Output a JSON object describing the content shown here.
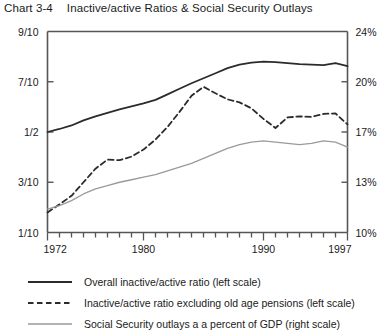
{
  "header": {
    "chart_number": "Chart 3-4",
    "title": "Inactive/active Ratios & Social Security Outlays"
  },
  "chart_data": {
    "type": "line",
    "title": "Inactive/active Ratios & Social Security Outlays",
    "xlabel": "",
    "ylabel": "",
    "grid": false,
    "legend_position": "below",
    "xlim": [
      1972,
      1997
    ],
    "x_tick_labels": [
      "1972",
      "1980",
      "1990",
      "1997"
    ],
    "x_tick_years": [
      1972,
      1980,
      1990,
      1997
    ],
    "x_minor_tick_years": [
      1972,
      1973,
      1974,
      1975,
      1976,
      1977,
      1978,
      1979,
      1980,
      1981,
      1982,
      1983,
      1984,
      1985,
      1986,
      1987,
      1988,
      1989,
      1990,
      1991,
      1992,
      1993,
      1994,
      1995,
      1996,
      1997
    ],
    "left_axis": {
      "label": "Inactive/active ratio",
      "tick_labels": [
        "9/10",
        "7/10",
        "1/2",
        "3/10",
        "1/10"
      ],
      "tick_values": [
        0.9,
        0.7,
        0.5,
        0.3,
        0.1
      ],
      "ylim": [
        0.1,
        0.9
      ]
    },
    "right_axis": {
      "label": "Percent of GDP",
      "tick_labels": [
        "24%",
        "20%",
        "17%",
        "13%",
        "10%"
      ],
      "tick_values": [
        24,
        20,
        17,
        13,
        10
      ],
      "ylim": [
        10,
        24
      ]
    },
    "x": [
      1972,
      1973,
      1974,
      1975,
      1976,
      1977,
      1978,
      1979,
      1980,
      1981,
      1982,
      1983,
      1984,
      1985,
      1986,
      1987,
      1988,
      1989,
      1990,
      1991,
      1992,
      1993,
      1994,
      1995,
      1996,
      1997
    ],
    "series": [
      {
        "name": "Overall inactive/active ratio (left scale)",
        "axis": "left",
        "style": "solid",
        "color": "#2b2b2b",
        "width": 1.8,
        "values": [
          0.5,
          0.512,
          0.526,
          0.546,
          0.562,
          0.576,
          0.59,
          0.602,
          0.614,
          0.628,
          0.65,
          0.672,
          0.694,
          0.714,
          0.734,
          0.754,
          0.768,
          0.776,
          0.78,
          0.778,
          0.774,
          0.77,
          0.768,
          0.766,
          0.774,
          0.762
        ]
      },
      {
        "name": "Inactive/active ratio excluding old age pensions (left scale)",
        "axis": "left",
        "style": "dashed",
        "color": "#2b2b2b",
        "width": 1.8,
        "values": [
          0.18,
          0.212,
          0.246,
          0.3,
          0.354,
          0.39,
          0.388,
          0.402,
          0.43,
          0.47,
          0.52,
          0.58,
          0.644,
          0.68,
          0.654,
          0.63,
          0.618,
          0.594,
          0.552,
          0.516,
          0.558,
          0.562,
          0.56,
          0.572,
          0.574,
          0.53
        ]
      },
      {
        "name": "Social Security outlays a a percent of GDP (right scale)",
        "axis": "right",
        "style": "solid",
        "color": "#9a9a9a",
        "width": 1.3,
        "values": [
          11.4,
          11.6,
          11.9,
          12.3,
          12.6,
          12.8,
          13.0,
          13.2,
          13.4,
          13.6,
          13.9,
          14.2,
          14.5,
          14.9,
          15.3,
          15.7,
          16.0,
          16.2,
          16.3,
          16.2,
          16.1,
          16.0,
          16.1,
          16.3,
          16.2,
          15.8
        ]
      }
    ]
  },
  "legend": {
    "items": [
      {
        "label": "Overall inactive/active ratio (left scale)",
        "style": "solid",
        "color": "#2b2b2b"
      },
      {
        "label": "Inactive/active ratio excluding old age pensions (left scale)",
        "style": "dashed",
        "color": "#2b2b2b"
      },
      {
        "label": "Social Security outlays a a percent of GDP (right scale)",
        "style": "solid",
        "color": "#9a9a9a"
      }
    ]
  }
}
